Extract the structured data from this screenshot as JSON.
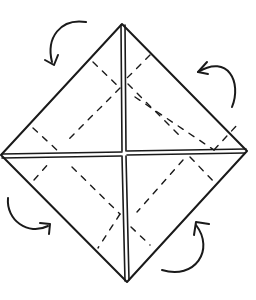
{
  "diagram": {
    "colors": {
      "line": "#1a1a1a",
      "background": "#ffffff"
    },
    "vertices": {
      "top": [
        122,
        24
      ],
      "right": [
        247,
        151
      ],
      "bottom": [
        127,
        282
      ],
      "left": [
        1,
        155
      ]
    },
    "center": [
      124,
      153
    ],
    "arrows": [
      {
        "name": "top-left",
        "direction": "fold-in"
      },
      {
        "name": "top-right",
        "direction": "fold-in"
      },
      {
        "name": "bottom-left",
        "direction": "fold-in"
      },
      {
        "name": "bottom-right",
        "direction": "fold-in"
      }
    ],
    "line_types": [
      "solid outline",
      "double-line center crease",
      "dashed fold line",
      "curved arrow"
    ]
  }
}
